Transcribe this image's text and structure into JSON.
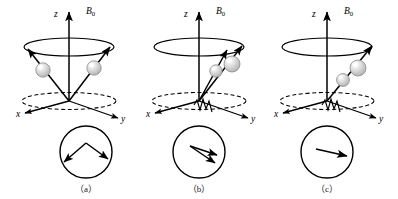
{
  "figure": {
    "background_color": "#ffffff",
    "stroke_color": "#000000",
    "sphere_fill": "#d9d9d9",
    "sphere_highlight": "#ffffff"
  },
  "panels": [
    {
      "id": "a",
      "label": "（a）",
      "axes": {
        "z": "z",
        "x": "x",
        "y": "y",
        "field": "B",
        "field_subscript": "0"
      },
      "spin_count": 2,
      "spin_arrangement": "opposed",
      "rf_wave": false,
      "vector_sum_arrows": 2,
      "vector_sum_description": "two arrows diverging from apex, cancelling transverse components"
    },
    {
      "id": "b",
      "label": "（b）",
      "axes": {
        "z": "z",
        "x": "x",
        "y": "y",
        "field": "B",
        "field_subscript": "0"
      },
      "spin_count": 2,
      "spin_arrangement": "partially-phased",
      "rf_wave": true,
      "vector_sum_arrows": 2,
      "vector_sum_description": "two close arrows pointing lower-right, partial phase coherence"
    },
    {
      "id": "c",
      "label": "（c）",
      "axes": {
        "z": "z",
        "x": "x",
        "y": "y",
        "field": "B",
        "field_subscript": "0"
      },
      "spin_count": 2,
      "spin_arrangement": "in-phase",
      "rf_wave": true,
      "vector_sum_arrows": 1,
      "vector_sum_description": "single arrow pointing right, full phase coherence"
    }
  ]
}
